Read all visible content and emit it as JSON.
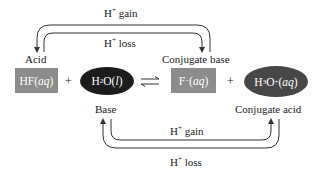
{
  "diagram": {
    "type": "acid-base conjugate pair reaction",
    "reactants": [
      {
        "id": "hf",
        "formula": "HF",
        "state": "aq",
        "role_label": "Acid",
        "shape": "rectangle",
        "color": "#8c8c8c"
      },
      {
        "id": "h2o",
        "formula_main": "H",
        "formula_sub": "2",
        "formula_rest": "O",
        "state": "l",
        "role_label": "Base",
        "shape": "ellipse",
        "color": "#1c1c1c"
      }
    ],
    "products": [
      {
        "id": "f-",
        "formula": "F",
        "charge": "−",
        "state": "aq",
        "role_label": "Conjugate base",
        "shape": "rectangle",
        "color": "#8c8c8c"
      },
      {
        "id": "h3o+",
        "formula_main": "H",
        "formula_sub": "3",
        "formula_rest": "O",
        "charge": "+",
        "state": "aq",
        "role_label": "Conjugate acid",
        "shape": "ellipse",
        "color": "#474747"
      }
    ],
    "plus_sign": "+",
    "equilibrium_arrow": "⇌",
    "top_arrows": {
      "gain_label_main": "H",
      "gain_label_sup": "+",
      "gain_label_text": " gain",
      "loss_label_main": "H",
      "loss_label_sup": "+",
      "loss_label_text": " loss",
      "connects": [
        "Acid",
        "Conjugate base"
      ]
    },
    "bottom_arrows": {
      "gain_label_main": "H",
      "gain_label_sup": "+",
      "gain_label_text": " gain",
      "loss_label_main": "H",
      "loss_label_sup": "+",
      "loss_label_text": " loss",
      "connects": [
        "Base",
        "Conjugate acid"
      ]
    },
    "paren_open": "(",
    "paren_close": ")"
  }
}
